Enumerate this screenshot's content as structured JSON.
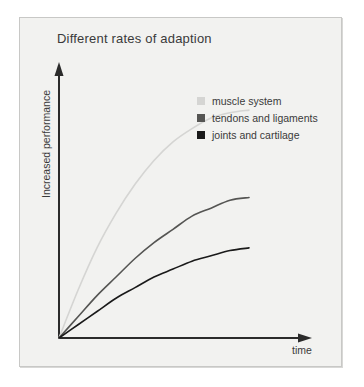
{
  "chart_data": {
    "type": "line",
    "title": "Different rates of adaption",
    "xlabel": "time",
    "ylabel": "Increased performance",
    "grid": false,
    "legend_position": "upper-right-inside",
    "xlim": [
      0,
      100
    ],
    "ylim": [
      0,
      100
    ],
    "axis_ticks": false,
    "axis_style": "arrow-axes",
    "x": [
      0,
      10,
      20,
      30,
      40,
      50,
      60,
      70,
      80,
      90,
      100
    ],
    "series": [
      {
        "name": "muscle system",
        "color": "#d5d5d3",
        "values": [
          0,
          18,
          34,
          47,
          58,
          67,
          74,
          79,
          83,
          85,
          86
        ]
      },
      {
        "name": "tendons and ligaments",
        "color": "#555553",
        "values": [
          0,
          8,
          16,
          23,
          30,
          36,
          41,
          46,
          49,
          52,
          53
        ]
      },
      {
        "name": "joints and cartilage",
        "color": "#1a1a1a",
        "values": [
          0,
          5,
          10,
          15,
          19,
          23,
          26,
          29,
          31,
          33,
          34
        ]
      }
    ]
  },
  "figure": {
    "background_color": "#f2f2f0",
    "border_color": "#c8c8c6",
    "axis_color": "#2b2b2b",
    "text_color": "#3a3a3a"
  },
  "legend": {
    "items": [
      {
        "label": "muscle system",
        "swatch_color": "#d5d5d3"
      },
      {
        "label": "tendons and ligaments",
        "swatch_color": "#555553"
      },
      {
        "label": "joints and cartilage",
        "swatch_color": "#1a1a1a"
      }
    ]
  }
}
